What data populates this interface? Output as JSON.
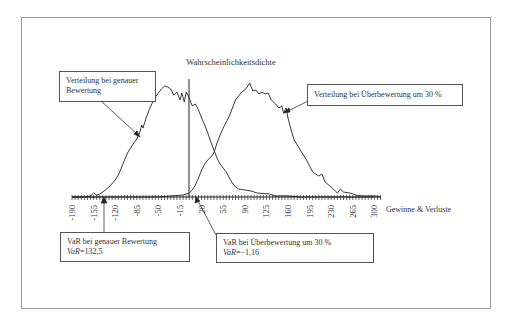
{
  "chart_data": {
    "type": "line",
    "title": "",
    "ylabel": "Wahrscheinlichkeitsdichte",
    "xlabel": "Gewinne & Verluste",
    "x_ticks": [
      -190,
      -155,
      -120,
      -85,
      -50,
      -15,
      20,
      55,
      90,
      125,
      160,
      195,
      230,
      265,
      300
    ],
    "xlim": [
      -190,
      310
    ],
    "grid": false,
    "legend": "none (annotation boxes)",
    "series": [
      {
        "name": "Verteilung bei genauer Bewertung",
        "x": [
          -190,
          -170,
          -160,
          -155,
          -150,
          -145,
          -140,
          -130,
          -120,
          -115,
          -110,
          -105,
          -100,
          -95,
          -90,
          -85,
          -80,
          -77,
          -75,
          -70,
          -65,
          -60,
          -55,
          -50,
          -45,
          -40,
          -35,
          -30,
          -25,
          -20,
          -15,
          -12,
          -8,
          -5,
          0,
          5,
          10,
          15,
          20,
          25,
          30,
          35,
          40,
          45,
          50,
          55,
          60,
          65,
          70,
          75,
          80,
          90,
          100,
          110,
          130,
          140,
          160,
          180,
          300
        ],
        "density_px": [
          0,
          0,
          1,
          4,
          2,
          3,
          5,
          10,
          17,
          22,
          29,
          37,
          44,
          49,
          54,
          58,
          65,
          72,
          69,
          79,
          87,
          94,
          100,
          104,
          108,
          111,
          110,
          108,
          102,
          105,
          97,
          104,
          95,
          105,
          99,
          91,
          93,
          87,
          79,
          72,
          64,
          55,
          47,
          39,
          33,
          29,
          25,
          19,
          14,
          10,
          8,
          7,
          6,
          4,
          3,
          1,
          1,
          0,
          0
        ]
      },
      {
        "name": "Verteilung bei Überbewertung um 30 %",
        "x": [
          -190,
          -50,
          -30,
          -10,
          0,
          5,
          10,
          15,
          20,
          25,
          30,
          35,
          40,
          45,
          50,
          55,
          60,
          65,
          70,
          75,
          80,
          85,
          90,
          95,
          98,
          103,
          108,
          113,
          118,
          123,
          128,
          133,
          140,
          145,
          150,
          153,
          157,
          160,
          165,
          170,
          180,
          190,
          200,
          210,
          215,
          220,
          230,
          240,
          245,
          250,
          260,
          270,
          280,
          300,
          310
        ],
        "density_px": [
          0,
          0,
          1,
          2,
          4,
          7,
          12,
          19,
          27,
          33,
          37,
          40,
          44,
          54,
          62,
          69,
          75,
          81,
          89,
          97,
          101,
          105,
          107,
          111,
          114,
          106,
          107,
          103,
          105,
          103,
          104,
          97,
          93,
          89,
          91,
          84,
          89,
          79,
          67,
          57,
          47,
          37,
          25,
          21,
          23,
          15,
          10,
          4,
          8,
          5,
          4,
          2,
          1,
          1,
          0
        ]
      }
    ],
    "annotations": [
      {
        "text": "Verteilung bei genauer Bewertung",
        "target": "left curve"
      },
      {
        "text": "Verteilung bei Überbewertung um 30 %",
        "target": "right curve"
      },
      {
        "text": "VaR bei genauer Bewertung",
        "value": "VaR=132,5",
        "marker_x": -132.5
      },
      {
        "text": "VaR bei Überbewertung um 30 %",
        "value": "VaR=−1,16",
        "marker_x": 1.16
      }
    ],
    "vertical_line_x": 0
  },
  "labels": {
    "y_axis": "Wahrscheinlichkeitsdichte",
    "x_axis": "Gewinne & Verluste",
    "ticks": [
      "-190",
      "-155",
      "-120",
      "-85",
      "-50",
      "-15",
      "20",
      "55",
      "90",
      "125",
      "160",
      "195",
      "230",
      "265",
      "300"
    ]
  },
  "boxes": {
    "dist_exact": {
      "line1": "Verteilung bei genauer",
      "line2": "Bewertung"
    },
    "dist_over": {
      "line1": "Verteilung bei Überbewertung um 30 %"
    },
    "var_exact": {
      "line1": "VaR bei genauer Bewertung",
      "var_label": "VaR",
      "var_value": "=132,5"
    },
    "var_over": {
      "line1": "VaR bei Überbewertung um 30 %",
      "var_label": "VaR",
      "var_value": "=−1,16"
    }
  },
  "colors": {
    "line": "#222222",
    "frame": "#9a9a9a",
    "box_border": "#555555"
  }
}
